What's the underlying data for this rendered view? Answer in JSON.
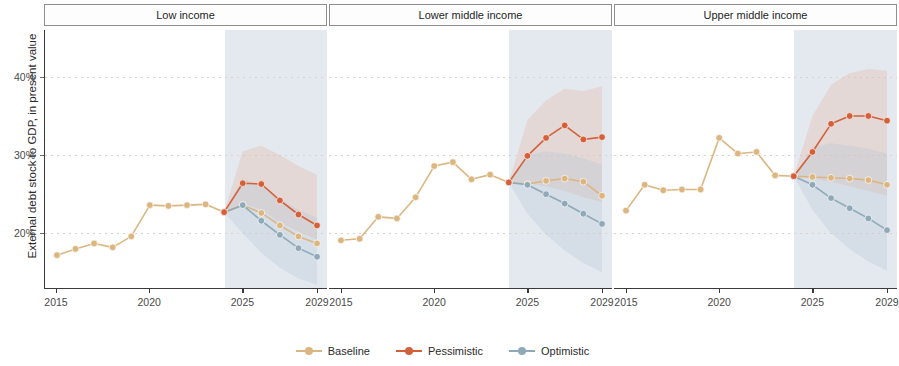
{
  "chart_data": {
    "type": "line",
    "title": "",
    "ylabel": "External debt stock to GDP, in present value",
    "xlabel": "",
    "ylim": [
      13,
      46
    ],
    "xlim": [
      2015,
      2029
    ],
    "yticks": [
      20,
      30,
      40
    ],
    "ytick_labels": [
      "20%",
      "30%",
      "40%"
    ],
    "xticks": [
      2015,
      2020,
      2025,
      2029
    ],
    "xtick_labels": [
      "2015",
      "2020",
      "2025",
      "2029"
    ],
    "grid": true,
    "legend_position": "bottom",
    "forecast_start": 2024,
    "colors": {
      "baseline": "#dcb681",
      "pessimistic": "#d4603a",
      "optimistic": "#8fa9b8",
      "forecast_shade": "#ccd7e2",
      "ribbon_pessimistic": "#e2b9a6",
      "ribbon_optimistic": "#b9c8d6"
    },
    "legend": [
      {
        "name": "Baseline",
        "color": "#dcb681"
      },
      {
        "name": "Pessimistic",
        "color": "#d4603a"
      },
      {
        "name": "Optimistic",
        "color": "#8fa9b8"
      }
    ],
    "panels": [
      {
        "label": "Low income",
        "x": [
          2015,
          2016,
          2017,
          2018,
          2019,
          2020,
          2021,
          2022,
          2023,
          2024,
          2025,
          2026,
          2027,
          2028,
          2029
        ],
        "series": [
          {
            "name": "Baseline",
            "values": [
              17.2,
              18.0,
              18.7,
              18.2,
              19.6,
              23.6,
              23.5,
              23.6,
              23.7,
              22.7,
              23.6,
              22.6,
              21.0,
              19.6,
              18.7
            ]
          },
          {
            "name": "Pessimistic",
            "values": [
              null,
              null,
              null,
              null,
              null,
              null,
              null,
              null,
              null,
              22.7,
              26.4,
              26.3,
              24.2,
              22.4,
              21.0
            ]
          },
          {
            "name": "Optimistic",
            "values": [
              null,
              null,
              null,
              null,
              null,
              null,
              null,
              null,
              null,
              22.7,
              23.6,
              21.6,
              19.8,
              18.1,
              17.0
            ]
          }
        ],
        "ribbons": [
          {
            "name": "Pessimistic band",
            "lower": [
              22.7,
              23.8,
              23.0,
              21.4,
              20.2,
              19.2
            ],
            "upper": [
              22.7,
              30.5,
              31.2,
              30.0,
              28.6,
              27.5
            ]
          },
          {
            "name": "Optimistic band",
            "lower": [
              22.7,
              20.0,
              17.5,
              15.6,
              14.2,
              13.4
            ],
            "upper": [
              22.7,
              27.0,
              26.0,
              24.4,
              23.0,
              22.0
            ]
          }
        ]
      },
      {
        "label": "Lower middle income",
        "x": [
          2015,
          2016,
          2017,
          2018,
          2019,
          2020,
          2021,
          2022,
          2023,
          2024,
          2025,
          2026,
          2027,
          2028,
          2029
        ],
        "series": [
          {
            "name": "Baseline",
            "values": [
              19.1,
              19.3,
              22.1,
              21.9,
              24.6,
              28.6,
              29.1,
              26.9,
              27.5,
              26.5,
              26.3,
              26.7,
              27.0,
              26.6,
              24.8
            ]
          },
          {
            "name": "Pessimistic",
            "values": [
              null,
              null,
              null,
              null,
              null,
              null,
              null,
              null,
              null,
              26.5,
              29.9,
              32.2,
              33.8,
              32.0,
              32.3
            ]
          },
          {
            "name": "Optimistic",
            "values": [
              null,
              null,
              null,
              null,
              null,
              null,
              null,
              null,
              null,
              26.5,
              26.2,
              25.0,
              23.8,
              22.5,
              21.2
            ]
          }
        ],
        "ribbons": [
          {
            "name": "Pessimistic band",
            "lower": [
              26.5,
              26.4,
              26.0,
              25.4,
              24.6,
              24.0
            ],
            "upper": [
              26.5,
              34.5,
              37.0,
              38.5,
              38.2,
              38.8
            ]
          },
          {
            "name": "Optimistic band",
            "lower": [
              26.5,
              22.5,
              19.8,
              17.8,
              16.2,
              15.0
            ],
            "upper": [
              26.5,
              30.0,
              30.5,
              30.2,
              29.6,
              28.8
            ]
          }
        ]
      },
      {
        "label": "Upper middle income",
        "x": [
          2015,
          2016,
          2017,
          2018,
          2019,
          2020,
          2021,
          2022,
          2023,
          2024,
          2025,
          2026,
          2027,
          2028,
          2029
        ],
        "values_note": "",
        "series": [
          {
            "name": "Baseline",
            "values": [
              22.9,
              26.2,
              25.5,
              25.6,
              25.6,
              32.2,
              30.2,
              30.4,
              27.4,
              27.3,
              27.2,
              27.1,
              27.0,
              26.8,
              26.2
            ]
          },
          {
            "name": "Pessimistic",
            "values": [
              null,
              null,
              null,
              null,
              null,
              null,
              null,
              null,
              null,
              27.3,
              30.4,
              34.0,
              35.0,
              35.0,
              34.4
            ]
          },
          {
            "name": "Optimistic",
            "values": [
              null,
              null,
              null,
              null,
              null,
              null,
              null,
              null,
              null,
              27.3,
              26.2,
              24.5,
              23.2,
              21.9,
              20.4
            ]
          }
        ],
        "ribbons": [
          {
            "name": "Pessimistic band",
            "lower": [
              27.3,
              27.0,
              26.6,
              26.0,
              25.4,
              24.8
            ],
            "upper": [
              27.3,
              35.0,
              39.0,
              40.5,
              41.0,
              40.8
            ]
          },
          {
            "name": "Optimistic band",
            "lower": [
              27.3,
              23.0,
              20.0,
              18.0,
              16.4,
              15.2
            ],
            "upper": [
              27.3,
              31.0,
              31.5,
              31.2,
              30.8,
              30.2
            ]
          }
        ]
      }
    ]
  }
}
